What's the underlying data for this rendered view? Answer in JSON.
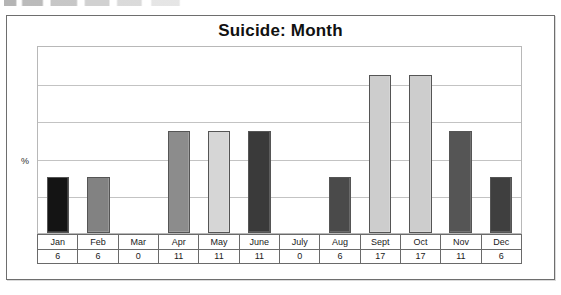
{
  "chart_data": {
    "type": "bar",
    "title": "Suicide: Month",
    "xlabel": "",
    "ylabel": "%",
    "ylim": [
      0,
      20
    ],
    "grid": true,
    "gridline_count": 4,
    "legend": "none",
    "categories": [
      "Jan",
      "Feb",
      "Mar",
      "Apr",
      "May",
      "June",
      "July",
      "Aug",
      "Sept",
      "Oct",
      "Nov",
      "Dec"
    ],
    "values": [
      6,
      6,
      0,
      11,
      11,
      11,
      0,
      6,
      17,
      17,
      11,
      6
    ],
    "bar_colors": [
      "#141414",
      "#828282",
      "#ffffff",
      "#8c8c8c",
      "#d6d6d6",
      "#3a3a3a",
      "#ffffff",
      "#4a4a4a",
      "#cdcdcd",
      "#cdcdcd",
      "#555555",
      "#3f3f3f"
    ],
    "data_table": {
      "label_row": [
        "Jan",
        "Feb",
        "Mar",
        "Apr",
        "May",
        "June",
        "July",
        "Aug",
        "Sept",
        "Oct",
        "Nov",
        "Dec"
      ],
      "value_row": [
        "6",
        "6",
        "0",
        "11",
        "11",
        "11",
        "0",
        "6",
        "17",
        "17",
        "11",
        "6"
      ]
    }
  },
  "frame": {
    "border_color": "#6e6e6e",
    "plot_border_color": "#b8b8b8",
    "gridline_color": "#c3c3c3"
  }
}
